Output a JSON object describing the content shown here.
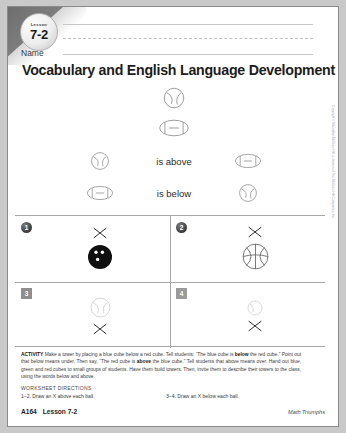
{
  "lesson": {
    "badge_label": "Lesson",
    "badge_number": "7-2",
    "name_label": "Name"
  },
  "title": "Vocabulary and English Language Development",
  "demo": {
    "top_ball": "baseball-icon",
    "bottom_ball": "football-icon",
    "above_word": "is above",
    "below_word": "is below",
    "above_left_ball": "baseball-icon",
    "above_right_ball": "football-icon",
    "below_left_ball": "football-icon",
    "below_right_ball": "baseball-icon"
  },
  "exercises": [
    {
      "number": "1",
      "badge_style": "circle",
      "ball": "bowling-ball-icon",
      "x_position": "above"
    },
    {
      "number": "2",
      "badge_style": "circle",
      "ball": "basketball-icon",
      "x_position": "above"
    },
    {
      "number": "3",
      "badge_style": "square",
      "ball": "baseball-icon",
      "x_position": "below"
    },
    {
      "number": "4",
      "badge_style": "square",
      "ball": "tennis-ball-icon",
      "x_position": "below"
    }
  ],
  "activity": {
    "label": "ACTIVITY",
    "text_1": " Make a tower by placing a blue cube below a red cube. Tell students: “The blue cube is ",
    "bold_1": "below",
    "text_2": " the red cube.” Point out that below means under. Then say, “The red cube is ",
    "bold_2": "above",
    "text_3": " the blue cube.” Tell students that above means over. Hand out blue, green and red cubes to small groups of students. Have them build towers. Then, invite them to describe their towers to the class, using the words below and above."
  },
  "worksheet_directions": {
    "heading": "WORKSHEET DIRECTIONS",
    "left": "1–2. Draw an X above each ball.",
    "right": "3–4. Draw an X below each ball."
  },
  "footer": {
    "page": "A164",
    "lesson": "Lesson 7-2",
    "series": "Math Triumphs"
  },
  "copyright": "Copyright © Macmillan/McGraw-Hill, a division of The McGraw-Hill Companies, Inc."
}
